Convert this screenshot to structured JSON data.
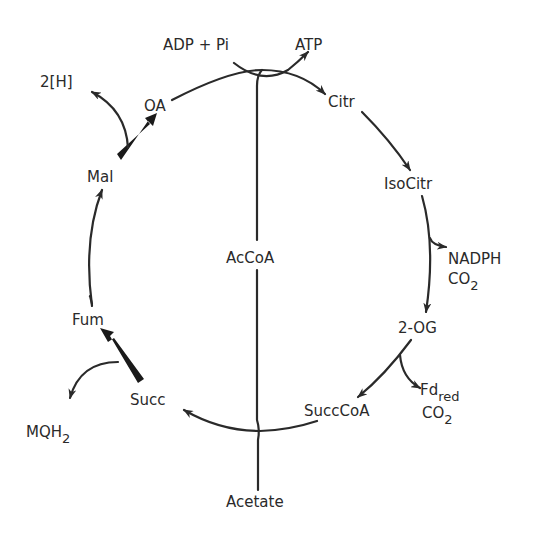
{
  "diagram": {
    "colors": {
      "line": "#2a2a2a",
      "background": "#ffffff"
    },
    "metabolites": {
      "citr": "Citr",
      "isocitr": "IsoCitr",
      "og": "2-OG",
      "succcoa": "SuccCoA",
      "succ": "Succ",
      "fum": "Fum",
      "mal": "Mal",
      "oa": "OA",
      "accoa": "AcCoA",
      "acetate": "Acetate"
    },
    "cofactors": {
      "adp_pi": "ADP + Pi",
      "atp": "ATP",
      "nadph": "NADPH",
      "co2_a_main": "CO",
      "co2_a_sub": "2",
      "fd_main": "Fd",
      "fd_sub": "red",
      "co2_b_main": "CO",
      "co2_b_sub": "2",
      "mqh_main": "MQH",
      "mqh_sub": "2",
      "two_h": "2[H]"
    },
    "edges": [
      {
        "from": "AcCoA",
        "to": "Citr",
        "type": "arrow"
      },
      {
        "from": "Citr",
        "to": "IsoCitr",
        "type": "arrow"
      },
      {
        "from": "IsoCitr",
        "to": "2-OG",
        "type": "arrow",
        "side_product": "NADPH, CO2"
      },
      {
        "from": "2-OG",
        "to": "SuccCoA",
        "type": "arrow",
        "side_product": "Fd red, CO2"
      },
      {
        "from": "SuccCoA",
        "to": "Succ",
        "type": "arrow"
      },
      {
        "from": "Succ",
        "to": "Fum",
        "type": "bold-arrow",
        "side_product": "MQH2"
      },
      {
        "from": "Fum",
        "to": "Mal",
        "type": "arrow"
      },
      {
        "from": "Mal",
        "to": "OA",
        "type": "bold-arrow",
        "side_product": "2[H]"
      },
      {
        "from": "Acetate",
        "to": "AcCoA",
        "type": "line",
        "cofactor_in": "ADP + Pi",
        "cofactor_out": "ATP"
      }
    ]
  }
}
